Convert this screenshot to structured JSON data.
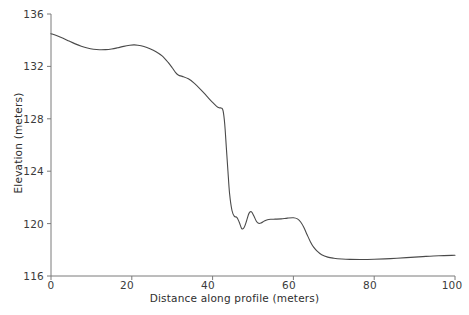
{
  "chart_data": {
    "type": "line",
    "title": "",
    "xlabel": "Distance along profile (meters)",
    "ylabel": "Elevation (meters)",
    "xlim": [
      0,
      100
    ],
    "ylim": [
      116,
      136
    ],
    "xticks": [
      0,
      20,
      40,
      60,
      80,
      100
    ],
    "yticks": [
      116,
      120,
      124,
      128,
      132,
      136
    ],
    "xtick_labels": [
      "0",
      "20",
      "40",
      "60",
      "80",
      "100"
    ],
    "ytick_labels": [
      "116",
      "120",
      "124",
      "128",
      "132",
      "136"
    ],
    "grid": false,
    "legend": null,
    "line_color": "#4a4a4a",
    "line_width": 1.1,
    "axis_color": "#7a7a7a",
    "background": "#ffffff",
    "series": [
      {
        "name": "Elevation profile",
        "x": [
          0.0,
          1.5,
          3.0,
          4.5,
          6.0,
          7.5,
          9.0,
          10.5,
          12.0,
          13.5,
          15.0,
          16.5,
          18.0,
          19.5,
          20.5,
          21.5,
          23.0,
          24.5,
          26.0,
          27.5,
          29.0,
          30.0,
          30.8,
          31.6,
          32.5,
          34.0,
          35.5,
          37.0,
          38.5,
          40.0,
          41.0,
          41.6,
          42.2,
          42.6,
          43.0,
          43.4,
          43.8,
          44.2,
          44.8,
          45.4,
          46.0,
          46.6,
          47.2,
          47.8,
          48.4,
          49.0,
          49.6,
          50.2,
          50.8,
          51.4,
          52.0,
          52.8,
          53.6,
          54.5,
          55.5,
          57.0,
          58.5,
          60.0,
          61.0,
          61.8,
          62.6,
          63.4,
          64.2,
          65.0,
          66.0,
          67.0,
          68.5,
          70.0,
          72.0,
          74.0,
          77.0,
          80.0,
          84.0,
          88.0,
          92.0,
          96.0,
          100.0
        ],
        "y": [
          134.5,
          134.34,
          134.15,
          133.93,
          133.72,
          133.54,
          133.4,
          133.31,
          133.27,
          133.28,
          133.33,
          133.42,
          133.53,
          133.61,
          133.64,
          133.62,
          133.52,
          133.35,
          133.12,
          132.8,
          132.3,
          131.9,
          131.55,
          131.32,
          131.24,
          131.05,
          130.7,
          130.25,
          129.75,
          129.25,
          128.95,
          128.84,
          128.82,
          128.6,
          127.6,
          125.8,
          124.0,
          122.3,
          121.0,
          120.55,
          120.48,
          120.1,
          119.62,
          119.7,
          120.2,
          120.78,
          120.9,
          120.6,
          120.2,
          120.02,
          120.05,
          120.2,
          120.3,
          120.33,
          120.34,
          120.36,
          120.42,
          120.45,
          120.36,
          120.12,
          119.7,
          119.15,
          118.62,
          118.2,
          117.86,
          117.62,
          117.44,
          117.36,
          117.3,
          117.27,
          117.26,
          117.28,
          117.33,
          117.4,
          117.48,
          117.55,
          117.58
        ]
      }
    ]
  }
}
